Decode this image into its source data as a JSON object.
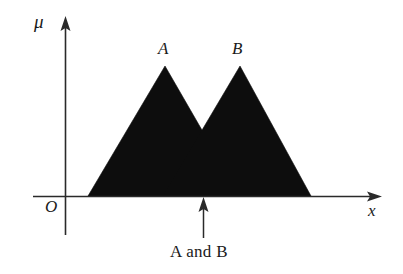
{
  "figure": {
    "background_color": "#ffffff",
    "ink_color": "#1a1a1a",
    "fill_color": "#0d0d0d",
    "axes": {
      "y_axis_label": "μ",
      "x_axis_label": "x",
      "origin_label": "O"
    },
    "labels": {
      "peak_a": "A",
      "peak_b": "B",
      "caption": "A and B"
    },
    "annotation": {
      "pointer_icon": "up-arrow-icon"
    }
  },
  "chart_data": {
    "type": "line",
    "title": "",
    "xlabel": "x",
    "ylabel": "μ",
    "grid": false,
    "legend": "none",
    "xlim": [
      0,
      1
    ],
    "ylim": [
      0,
      1
    ],
    "series": [
      {
        "name": "A",
        "label": "A",
        "shape": "triangle",
        "fill": true,
        "points_px": [
          [
            88,
            196
          ],
          [
            165,
            66
          ],
          [
            240,
            196
          ]
        ],
        "peak_label_px": [
          164,
          50
        ],
        "support": [
          0.17,
          0.86
        ],
        "peak": 0.52,
        "values": [
          0,
          1,
          0
        ]
      },
      {
        "name": "B",
        "label": "B",
        "shape": "triangle",
        "fill": true,
        "points_px": [
          [
            163,
            196
          ],
          [
            240,
            66
          ],
          [
            311,
            196
          ]
        ],
        "peak_label_px": [
          238,
          50
        ],
        "support": [
          0.4,
          1.08
        ],
        "peak": 0.76,
        "values": [
          0,
          1,
          0
        ]
      }
    ],
    "annotations": [
      {
        "text": "A and B",
        "type": "arrow",
        "arrow_from_px": [
          203,
          236
        ],
        "arrow_to_px": [
          203,
          199
        ],
        "x_px": 203,
        "crossover_px": [
          205,
          133
        ],
        "description": "crossover point where membership of A equals membership of B"
      }
    ]
  }
}
